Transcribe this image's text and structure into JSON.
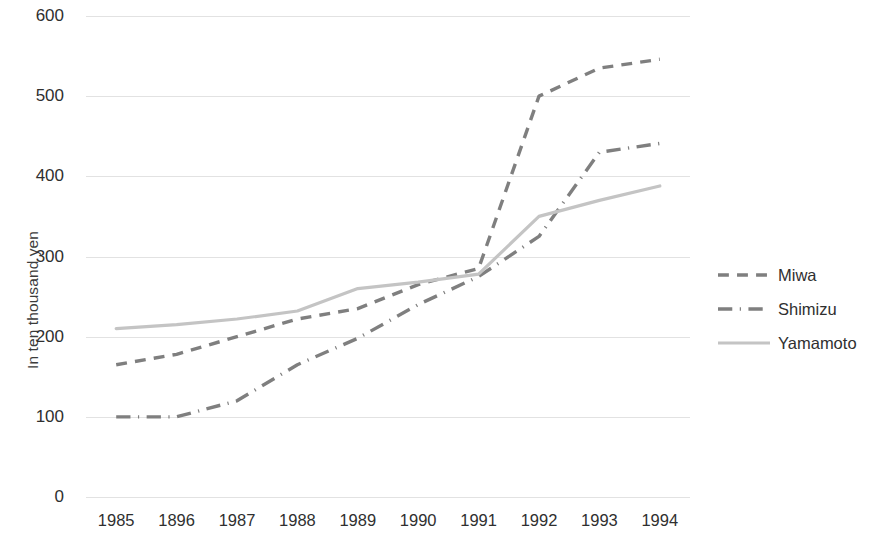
{
  "chart_data": {
    "type": "line",
    "title": "",
    "xlabel": "",
    "ylabel": "In ten thousand yen",
    "categories": [
      "1985",
      "1896",
      "1987",
      "1988",
      "1989",
      "1990",
      "1991",
      "1992",
      "1993",
      "1994"
    ],
    "ylim": [
      0,
      600
    ],
    "yticks": [
      0,
      100,
      200,
      300,
      400,
      500,
      600
    ],
    "ytick_labels": [
      "0",
      "100",
      "200",
      "300",
      "400",
      "500",
      "600"
    ],
    "grid": true,
    "legend_position": "right",
    "series": [
      {
        "name": "Miwa",
        "style": "dashed",
        "color": "#7f7f7f",
        "values": [
          165,
          178,
          200,
          222,
          235,
          265,
          285,
          500,
          535,
          546
        ]
      },
      {
        "name": "Shimizu",
        "style": "dash-dot",
        "color": "#7f7f7f",
        "values": [
          100,
          100,
          120,
          165,
          198,
          240,
          275,
          325,
          430,
          441
        ]
      },
      {
        "name": "Yamamoto",
        "style": "solid",
        "color": "#c4c4c4",
        "values": [
          210,
          215,
          222,
          232,
          260,
          268,
          278,
          350,
          370,
          388
        ]
      }
    ]
  },
  "legend": {
    "items": [
      {
        "label": "Miwa"
      },
      {
        "label": "Shimizu"
      },
      {
        "label": "Yamamoto"
      }
    ]
  },
  "axes": {
    "y_title": "In ten thousand yen"
  },
  "colors": {
    "gridline": "#e2e2e2",
    "text": "#2f2f2f",
    "series_dark": "#7f7f7f",
    "series_light": "#c4c4c4",
    "background": "#ffffff"
  }
}
